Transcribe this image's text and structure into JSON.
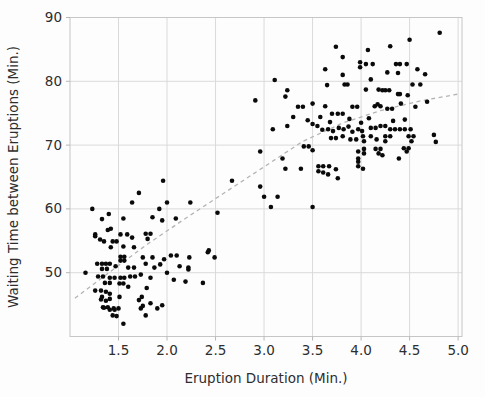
{
  "figure": {
    "background": "#fdfdfd"
  },
  "chart_data": {
    "type": "scatter",
    "title": "",
    "xlabel": "Eruption Duration (Min.)",
    "ylabel": "Waiting Time between Eruptions (Min.)",
    "xlim": [
      1.0,
      5.04
    ],
    "ylim": [
      40,
      90
    ],
    "x_ticks": [
      1.5,
      2.0,
      2.5,
      3.0,
      3.5,
      4.0,
      4.5,
      5.0
    ],
    "y_ticks": [
      50,
      60,
      70,
      80,
      90
    ],
    "grid": true,
    "legend": false,
    "marker_color": "#0a0a0a",
    "marker_radius": 2.3,
    "grid_color": "#dadada",
    "spine_color": "#c6c6c6",
    "tick_color": "#b7b7b7",
    "tick_text_color": "#2e2e2e",
    "trend_line": {
      "style": "dashed",
      "color": "#b4b4b4",
      "points": [
        [
          1.05,
          46.0
        ],
        [
          1.4,
          50.0
        ],
        [
          1.8,
          54.5
        ],
        [
          2.2,
          58.6
        ],
        [
          2.6,
          62.6
        ],
        [
          3.0,
          66.6
        ],
        [
          3.4,
          70.6
        ],
        [
          3.8,
          73.4
        ],
        [
          4.2,
          75.4
        ],
        [
          4.6,
          76.9
        ],
        [
          5.0,
          78.0
        ]
      ]
    },
    "points": [
      [
        1.16,
        50.0
      ],
      [
        1.23,
        60.0
      ],
      [
        1.26,
        56.0
      ],
      [
        1.26,
        55.7
      ],
      [
        1.26,
        47.2
      ],
      [
        1.28,
        51.4
      ],
      [
        1.29,
        49.4
      ],
      [
        1.31,
        55.2
      ],
      [
        1.32,
        47.2
      ],
      [
        1.32,
        45.8
      ],
      [
        1.33,
        58.4
      ],
      [
        1.33,
        51.4
      ],
      [
        1.33,
        50.6
      ],
      [
        1.33,
        46.2
      ],
      [
        1.34,
        49.4
      ],
      [
        1.34,
        44.6
      ],
      [
        1.35,
        54.9
      ],
      [
        1.35,
        44.5
      ],
      [
        1.36,
        48.4
      ],
      [
        1.37,
        51.4
      ],
      [
        1.37,
        47.0
      ],
      [
        1.37,
        45.6
      ],
      [
        1.38,
        50.6
      ],
      [
        1.39,
        56.7
      ],
      [
        1.39,
        44.6
      ],
      [
        1.4,
        59.2
      ],
      [
        1.41,
        51.4
      ],
      [
        1.41,
        49.2
      ],
      [
        1.41,
        48.4
      ],
      [
        1.41,
        46.7
      ],
      [
        1.41,
        45.9
      ],
      [
        1.41,
        44.2
      ],
      [
        1.42,
        56.9
      ],
      [
        1.42,
        54.0
      ],
      [
        1.44,
        54.9
      ],
      [
        1.44,
        43.3
      ],
      [
        1.45,
        44.4
      ],
      [
        1.46,
        49.2
      ],
      [
        1.46,
        44.2
      ],
      [
        1.47,
        51.0
      ],
      [
        1.48,
        54.9
      ],
      [
        1.48,
        43.2
      ],
      [
        1.5,
        44.4
      ],
      [
        1.51,
        48.3
      ],
      [
        1.51,
        46.2
      ],
      [
        1.52,
        56.0
      ],
      [
        1.52,
        52.5
      ],
      [
        1.52,
        51.9
      ],
      [
        1.52,
        49.2
      ],
      [
        1.55,
        58.5
      ],
      [
        1.55,
        54.1
      ],
      [
        1.55,
        48.3
      ],
      [
        1.55,
        42.0
      ],
      [
        1.56,
        52.5
      ],
      [
        1.56,
        51.9
      ],
      [
        1.56,
        49.2
      ],
      [
        1.59,
        56.0
      ],
      [
        1.6,
        50.8
      ],
      [
        1.6,
        47.8
      ],
      [
        1.62,
        49.4
      ],
      [
        1.64,
        55.5
      ],
      [
        1.64,
        61.0
      ],
      [
        1.66,
        54.0
      ],
      [
        1.66,
        50.8
      ],
      [
        1.67,
        49.4
      ],
      [
        1.71,
        62.5
      ],
      [
        1.71,
        45.7
      ],
      [
        1.73,
        49.7
      ],
      [
        1.73,
        44.4
      ],
      [
        1.74,
        46.2
      ],
      [
        1.75,
        52.4
      ],
      [
        1.75,
        44.8
      ],
      [
        1.78,
        56.1
      ],
      [
        1.78,
        51.4
      ],
      [
        1.78,
        43.3
      ],
      [
        1.79,
        47.6
      ],
      [
        1.8,
        55.3
      ],
      [
        1.83,
        56.1
      ],
      [
        1.83,
        49.2
      ],
      [
        1.83,
        45.2
      ],
      [
        1.85,
        58.7
      ],
      [
        1.85,
        52.4
      ],
      [
        1.87,
        50.8
      ],
      [
        1.9,
        44.4
      ],
      [
        1.92,
        60.0
      ],
      [
        1.93,
        51.3
      ],
      [
        1.95,
        58.2
      ],
      [
        1.95,
        44.9
      ],
      [
        1.96,
        64.4
      ],
      [
        1.97,
        52.1
      ],
      [
        2.0,
        61.0
      ],
      [
        2.0,
        50.0
      ],
      [
        2.04,
        52.7
      ],
      [
        2.07,
        48.9
      ],
      [
        2.09,
        58.5
      ],
      [
        2.1,
        52.7
      ],
      [
        2.13,
        51.0
      ],
      [
        2.19,
        48.6
      ],
      [
        2.24,
        61.0
      ],
      [
        2.22,
        50.8
      ],
      [
        2.22,
        50.5
      ],
      [
        2.23,
        52.4
      ],
      [
        2.37,
        48.4
      ],
      [
        2.42,
        53.2
      ],
      [
        2.43,
        53.5
      ],
      [
        2.49,
        52.4
      ],
      [
        2.52,
        59.4
      ],
      [
        2.67,
        64.4
      ],
      [
        2.91,
        77.0
      ],
      [
        2.96,
        69.0
      ],
      [
        2.96,
        63.5
      ],
      [
        3.0,
        61.9
      ],
      [
        3.07,
        60.3
      ],
      [
        3.09,
        72.5
      ],
      [
        3.11,
        80.2
      ],
      [
        3.14,
        61.9
      ],
      [
        3.19,
        67.9
      ],
      [
        3.22,
        66.3
      ],
      [
        3.22,
        77.6
      ],
      [
        3.24,
        73.0
      ],
      [
        3.24,
        78.6
      ],
      [
        3.5,
        60.3
      ],
      [
        3.63,
        81.9
      ],
      [
        3.65,
        79.4
      ],
      [
        3.74,
        85.4
      ],
      [
        3.81,
        83.8
      ],
      [
        3.81,
        81.0
      ],
      [
        3.83,
        79.5
      ],
      [
        3.86,
        79.5
      ],
      [
        3.99,
        83.0
      ],
      [
        3.99,
        82.2
      ],
      [
        4.05,
        82.7
      ],
      [
        4.05,
        78.7
      ],
      [
        4.07,
        84.9
      ],
      [
        4.1,
        80.3
      ],
      [
        4.12,
        82.7
      ],
      [
        4.18,
        78.7
      ],
      [
        4.22,
        78.6
      ],
      [
        4.25,
        78.6
      ],
      [
        4.27,
        81.4
      ],
      [
        4.29,
        78.6
      ],
      [
        4.3,
        85.5
      ],
      [
        4.36,
        82.7
      ],
      [
        4.38,
        81.3
      ],
      [
        4.38,
        78.0
      ],
      [
        4.4,
        82.7
      ],
      [
        4.4,
        78.0
      ],
      [
        4.47,
        82.7
      ],
      [
        4.48,
        77.8
      ],
      [
        4.5,
        86.5
      ],
      [
        4.53,
        79.5
      ],
      [
        4.58,
        81.9
      ],
      [
        4.61,
        79.5
      ],
      [
        4.66,
        81.1
      ],
      [
        4.81,
        87.6
      ],
      [
        3.35,
        76.0
      ],
      [
        3.4,
        76.0
      ],
      [
        3.5,
        76.5
      ],
      [
        3.63,
        76.1
      ],
      [
        3.7,
        74.9
      ],
      [
        3.76,
        74.9
      ],
      [
        3.81,
        74.9
      ],
      [
        3.91,
        76.0
      ],
      [
        3.96,
        76.0
      ],
      [
        4.14,
        76.1
      ],
      [
        4.17,
        76.4
      ],
      [
        4.2,
        76.1
      ],
      [
        4.27,
        75.7
      ],
      [
        4.32,
        75.7
      ],
      [
        4.41,
        76.5
      ],
      [
        4.56,
        76.0
      ],
      [
        4.68,
        76.8
      ],
      [
        3.3,
        74.4
      ],
      [
        3.45,
        73.9
      ],
      [
        3.58,
        74.4
      ],
      [
        3.68,
        73.6
      ],
      [
        3.88,
        74.1
      ],
      [
        4.0,
        73.5
      ],
      [
        4.08,
        74.2
      ],
      [
        4.33,
        73.8
      ],
      [
        4.45,
        74.0
      ],
      [
        3.5,
        73.3
      ],
      [
        3.55,
        73.0
      ],
      [
        3.6,
        72.4
      ],
      [
        3.66,
        72.5
      ],
      [
        3.71,
        72.2
      ],
      [
        3.77,
        72.7
      ],
      [
        3.82,
        72.5
      ],
      [
        3.87,
        72.9
      ],
      [
        3.91,
        72.1
      ],
      [
        3.97,
        72.5
      ],
      [
        4.01,
        72.2
      ],
      [
        4.1,
        72.7
      ],
      [
        4.15,
        72.7
      ],
      [
        4.2,
        73.0
      ],
      [
        4.25,
        73.0
      ],
      [
        4.3,
        72.5
      ],
      [
        4.35,
        72.5
      ],
      [
        4.4,
        72.5
      ],
      [
        4.45,
        72.5
      ],
      [
        4.51,
        72.5
      ],
      [
        3.69,
        71.1
      ],
      [
        3.74,
        71.1
      ],
      [
        3.81,
        71.4
      ],
      [
        3.89,
        70.9
      ],
      [
        3.95,
        70.9
      ],
      [
        4.02,
        71.4
      ],
      [
        4.03,
        70.6
      ],
      [
        4.1,
        71.4
      ],
      [
        4.16,
        70.9
      ],
      [
        4.25,
        71.4
      ],
      [
        4.25,
        70.6
      ],
      [
        4.3,
        71.4
      ],
      [
        4.49,
        71.4
      ],
      [
        4.52,
        70.6
      ],
      [
        4.54,
        71.4
      ],
      [
        4.75,
        71.6
      ],
      [
        4.77,
        70.5
      ],
      [
        3.41,
        69.8
      ],
      [
        3.46,
        69.8
      ],
      [
        3.5,
        69.2
      ],
      [
        3.97,
        69.0
      ],
      [
        3.97,
        67.9
      ],
      [
        3.97,
        67.4
      ],
      [
        4.03,
        69.4
      ],
      [
        4.03,
        68.7
      ],
      [
        4.15,
        69.4
      ],
      [
        4.18,
        68.7
      ],
      [
        4.2,
        69.4
      ],
      [
        4.22,
        68.4
      ],
      [
        4.39,
        67.9
      ],
      [
        4.44,
        69.5
      ],
      [
        4.47,
        69.0
      ],
      [
        4.49,
        69.5
      ],
      [
        3.38,
        66.3
      ],
      [
        3.56,
        66.7
      ],
      [
        3.56,
        65.9
      ],
      [
        3.61,
        66.7
      ],
      [
        3.61,
        65.7
      ],
      [
        3.67,
        66.7
      ],
      [
        3.74,
        66.2
      ],
      [
        3.76,
        64.8
      ],
      [
        3.66,
        65.4
      ],
      [
        3.97,
        66.7
      ],
      [
        4.02,
        66.3
      ]
    ]
  }
}
